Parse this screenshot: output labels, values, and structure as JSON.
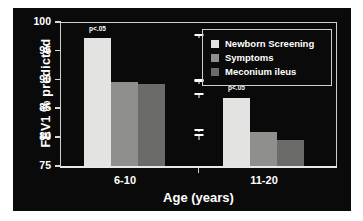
{
  "chart_data": {
    "type": "bar",
    "title": "",
    "subtitle": "",
    "xlabel": "Age (years)",
    "ylabel": "FEV1 % predicted",
    "categories": [
      "6-10",
      "11-20"
    ],
    "ylim": [
      75,
      100
    ],
    "yticks": [
      "75",
      "80",
      "85",
      "90",
      "95",
      "100"
    ],
    "grid": false,
    "legend_position": "top-right",
    "background_color": "#0a0a0a",
    "text_color": "#ffffff",
    "series": [
      {
        "name": "Newborn Screening",
        "color": "#e3e3e1",
        "values": [
          97.3,
          86.8
        ],
        "errors": [
          0.6,
          0.8
        ]
      },
      {
        "name": "Symptoms",
        "color": "#8f8f8d",
        "values": [
          89.5,
          80.9
        ],
        "errors": [
          0.4,
          0.4
        ]
      },
      {
        "name": "Meconium ileus",
        "color": "#6b6b69",
        "values": [
          89.2,
          79.6
        ],
        "errors": [
          0.7,
          0.9
        ]
      }
    ],
    "annotations": [
      {
        "text": "p<.05",
        "category": "6-10",
        "series": "Newborn Screening"
      },
      {
        "text": "p<.05",
        "category": "11-20",
        "series": "Newborn Screening"
      }
    ]
  }
}
